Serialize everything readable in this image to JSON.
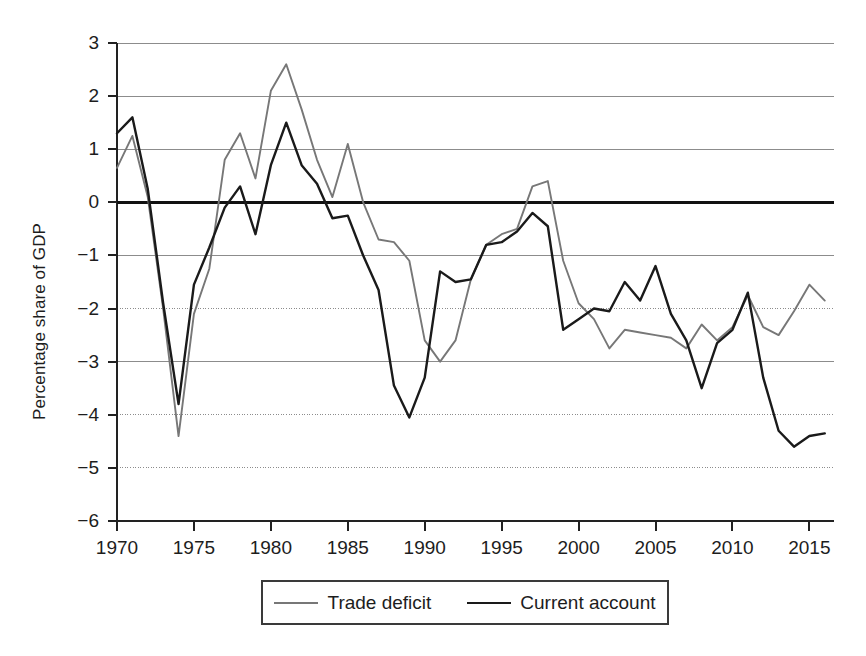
{
  "chart_data": {
    "type": "line",
    "title": "",
    "xlabel": "",
    "ylabel": "Percentage share of GDP",
    "xlim": [
      1970,
      2016.6
    ],
    "ylim": [
      -6,
      3
    ],
    "grid": true,
    "zero_line": true,
    "legend_position": "bottom",
    "x_ticks": [
      "1970",
      "1975",
      "1980",
      "1985",
      "1990",
      "1995",
      "2000",
      "2005",
      "2010",
      "2015"
    ],
    "y_ticks": [
      "3",
      "2",
      "1",
      "0",
      "−1",
      "−2",
      "−3",
      "−4",
      "−5",
      "−6"
    ],
    "x": [
      1970,
      1971,
      1972,
      1973,
      1974,
      1975,
      1976,
      1977,
      1978,
      1979,
      1980,
      1981,
      1982,
      1983,
      1984,
      1985,
      1986,
      1987,
      1988,
      1989,
      1990,
      1991,
      1992,
      1993,
      1994,
      1995,
      1996,
      1997,
      1998,
      1999,
      2000,
      2001,
      2002,
      2003,
      2004,
      2005,
      2006,
      2007,
      2008,
      2009,
      2010,
      2011,
      2012,
      2013,
      2014,
      2015,
      2016
    ],
    "series": [
      {
        "name": "Trade deficit",
        "color": "#777777",
        "values": [
          0.65,
          1.25,
          0.1,
          -2.0,
          -4.4,
          -2.1,
          -1.25,
          0.8,
          1.3,
          0.45,
          2.1,
          2.6,
          1.75,
          0.8,
          0.1,
          1.1,
          0.0,
          -0.7,
          -0.75,
          -1.1,
          -2.6,
          -3.0,
          -2.6,
          -1.45,
          -0.8,
          -0.6,
          -0.5,
          0.3,
          0.4,
          -1.1,
          -1.9,
          -2.2,
          -2.75,
          -2.4,
          -2.45,
          -2.5,
          -2.55,
          -2.75,
          -2.3,
          -2.6,
          -2.35,
          -1.75,
          -2.35,
          -2.5,
          -2.05,
          -1.55,
          -1.85
        ]
      },
      {
        "name": "Current account",
        "color": "#1a1a1a",
        "values": [
          1.3,
          1.6,
          0.25,
          -1.9,
          -3.8,
          -1.55,
          -0.85,
          -0.1,
          0.3,
          -0.6,
          0.7,
          1.5,
          0.7,
          0.35,
          -0.3,
          -0.25,
          -1.0,
          -1.65,
          -3.45,
          -4.05,
          -3.3,
          -1.3,
          -1.5,
          -1.45,
          -0.8,
          -0.75,
          -0.55,
          -0.2,
          -0.45,
          -2.4,
          -2.2,
          -2.0,
          -2.05,
          -1.5,
          -1.85,
          -1.2,
          -2.1,
          -2.6,
          -3.5,
          -2.65,
          -2.4,
          -1.7,
          -3.3,
          -4.3,
          -4.6,
          -4.4,
          -4.35
        ]
      }
    ]
  },
  "legend": {
    "entries": [
      {
        "label": "Trade deficit"
      },
      {
        "label": "Current account"
      }
    ]
  }
}
